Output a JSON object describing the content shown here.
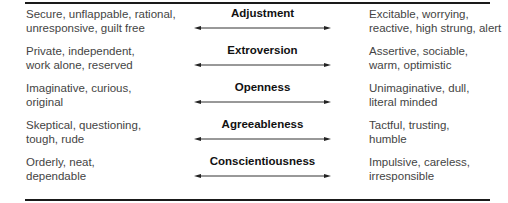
{
  "diagram": {
    "rows": [
      {
        "trait": "Adjustment",
        "low": [
          "Secure, unflappable, rational,",
          "unresponsive, guilt free"
        ],
        "high": [
          "Excitable, worrying,",
          "reactive, high strung, alert"
        ]
      },
      {
        "trait": "Extroversion",
        "low": [
          "Private, independent,",
          "work alone, reserved"
        ],
        "high": [
          "Assertive, sociable,",
          "warm, optimistic"
        ]
      },
      {
        "trait": "Openness",
        "low": [
          "Imaginative, curious,",
          "original"
        ],
        "high": [
          "Unimaginative, dull,",
          "literal minded"
        ]
      },
      {
        "trait": "Agreeableness",
        "low": [
          "Skeptical, questioning,",
          "tough, rude"
        ],
        "high": [
          "Tactful, trusting,",
          "humble"
        ]
      },
      {
        "trait": "Conscientiousness",
        "low": [
          "Orderly, neat,",
          "dependable"
        ],
        "high": [
          "Impulsive, careless,",
          "irresponsible"
        ]
      }
    ],
    "arrow_icon": "double-headed-arrow-icon",
    "colors": {
      "rule": "#1a1a1a",
      "text": "#444444",
      "trait": "#111111"
    }
  }
}
